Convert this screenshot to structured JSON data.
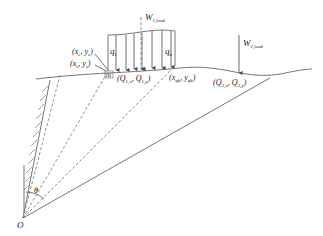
{
  "labels": {
    "w1": "W",
    "w1_sub": "1,load",
    "w2": "W",
    "w2_sub": "2,load",
    "q1": "q",
    "q1_sub": "1",
    "qk": "q",
    "qk_sub": "k",
    "pt_e1": "(x",
    "pt_e1_sub1": "e",
    "pt_e1_mid": ", y",
    "pt_e1_sub2": "e",
    "pt_e1_end": ")",
    "pt_s1": "(x",
    "pt_s1_sub1": "s",
    "pt_s1_mid": ", y",
    "pt_s1_sub2": "s",
    "pt_s1_end": ")",
    "pt_qk": "(x",
    "pt_qk_sub1": "qk",
    "pt_qk_mid": ", y",
    "pt_qk_sub2": "qk",
    "pt_qk_end": ")",
    "q1pt": "(Q",
    "q1pt_sub1": "1,x",
    "q1pt_mid": ", Q",
    "q1pt_sub2": "1,y",
    "q1pt_end": ")",
    "q2pt": "(Q",
    "q2pt_sub1": "2,x",
    "q2pt_mid": ", Q",
    "q2pt_sub2": "2,y",
    "q2pt_end": ")",
    "delta": "Δl",
    "theta": "θ",
    "origin": "O"
  },
  "colors": {
    "line": "#666666",
    "dashed": "#777777",
    "text": "#222222",
    "background": "#ffffff"
  }
}
